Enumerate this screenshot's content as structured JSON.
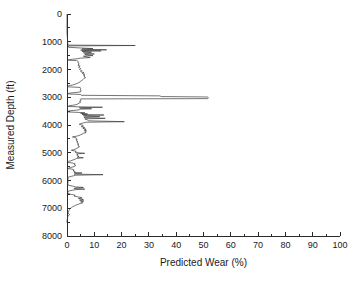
{
  "chart_data": {
    "type": "line",
    "title": "",
    "xlabel": "Predicted Wear (%)",
    "ylabel": "Measured Depth (ft)",
    "xlim": [
      0,
      100
    ],
    "ylim": [
      8000,
      0
    ],
    "y_inverted": true,
    "grid": false,
    "legend": null,
    "x_ticks": [
      0,
      10,
      20,
      30,
      40,
      50,
      60,
      70,
      80,
      90,
      100
    ],
    "x_tick_labels": [
      "0",
      "10",
      "20",
      "30",
      "40",
      "50",
      "60",
      "70",
      "80",
      "90",
      "100"
    ],
    "x_minor_tick_step": 5,
    "y_ticks": [
      0,
      1000,
      2000,
      3000,
      4000,
      5000,
      6000,
      7000,
      8000
    ],
    "y_tick_labels": [
      "0",
      "1000",
      "2000",
      "3000",
      "4000",
      "5000",
      "6000",
      "7000",
      "8000"
    ],
    "y_minor_tick_step": 500,
    "series": [
      {
        "name": "Predicted Wear",
        "color": "#3a3a3a",
        "x_key": "wear_percent",
        "y_key": "depth_ft",
        "points": [
          [
            0.0,
            0
          ],
          [
            0.0,
            700
          ],
          [
            0.2,
            900
          ],
          [
            0.3,
            1080
          ],
          [
            0.4,
            1120
          ],
          [
            25.0,
            1135
          ],
          [
            0.5,
            1150
          ],
          [
            0.6,
            1200
          ],
          [
            6.0,
            1230
          ],
          [
            9.5,
            1245
          ],
          [
            5.5,
            1260
          ],
          [
            7.0,
            1275
          ],
          [
            14.5,
            1290
          ],
          [
            5.0,
            1300
          ],
          [
            6.5,
            1315
          ],
          [
            12.5,
            1330
          ],
          [
            5.5,
            1345
          ],
          [
            7.5,
            1360
          ],
          [
            9.0,
            1380
          ],
          [
            6.0,
            1400
          ],
          [
            7.0,
            1420
          ],
          [
            10.0,
            1440
          ],
          [
            6.5,
            1460
          ],
          [
            7.5,
            1480
          ],
          [
            9.5,
            1500
          ],
          [
            6.0,
            1520
          ],
          [
            7.0,
            1545
          ],
          [
            8.5,
            1570
          ],
          [
            5.0,
            1590
          ],
          [
            4.0,
            1610
          ],
          [
            2.0,
            1630
          ],
          [
            0.4,
            1650
          ],
          [
            0.5,
            1665
          ],
          [
            3.5,
            1680
          ],
          [
            4.2,
            1720
          ],
          [
            4.0,
            1760
          ],
          [
            4.5,
            1800
          ],
          [
            4.0,
            1840
          ],
          [
            4.8,
            1880
          ],
          [
            4.2,
            1920
          ],
          [
            5.0,
            1960
          ],
          [
            4.6,
            2000
          ],
          [
            5.4,
            2040
          ],
          [
            5.0,
            2080
          ],
          [
            6.2,
            2110
          ],
          [
            5.6,
            2140
          ],
          [
            6.5,
            2170
          ],
          [
            6.0,
            2200
          ],
          [
            6.6,
            2230
          ],
          [
            6.2,
            2260
          ],
          [
            6.8,
            2290
          ],
          [
            6.3,
            2320
          ],
          [
            6.0,
            2350
          ],
          [
            5.6,
            2380
          ],
          [
            5.2,
            2410
          ],
          [
            4.8,
            2440
          ],
          [
            4.4,
            2470
          ],
          [
            3.8,
            2500
          ],
          [
            3.0,
            2530
          ],
          [
            2.0,
            2560
          ],
          [
            0.8,
            2580
          ],
          [
            0.3,
            2600
          ],
          [
            0.4,
            2625
          ],
          [
            4.8,
            2645
          ],
          [
            5.0,
            2680
          ],
          [
            4.8,
            2710
          ],
          [
            5.2,
            2740
          ],
          [
            4.9,
            2770
          ],
          [
            5.1,
            2800
          ],
          [
            4.0,
            2820
          ],
          [
            2.0,
            2840
          ],
          [
            0.5,
            2860
          ],
          [
            0.4,
            2880
          ],
          [
            5.0,
            2900
          ],
          [
            5.2,
            2930
          ],
          [
            34.0,
            2950
          ],
          [
            34.5,
            2975
          ],
          [
            51.5,
            2990
          ],
          [
            51.8,
            3030
          ],
          [
            51.5,
            3050
          ],
          [
            5.0,
            3060
          ],
          [
            4.8,
            3090
          ],
          [
            5.2,
            3120
          ],
          [
            4.6,
            3150
          ],
          [
            5.0,
            3180
          ],
          [
            4.4,
            3210
          ],
          [
            4.0,
            3240
          ],
          [
            3.2,
            3270
          ],
          [
            2.0,
            3290
          ],
          [
            0.6,
            3310
          ],
          [
            0.4,
            3330
          ],
          [
            4.0,
            3345
          ],
          [
            13.0,
            3360
          ],
          [
            4.5,
            3375
          ],
          [
            5.0,
            3400
          ],
          [
            9.0,
            3415
          ],
          [
            4.8,
            3430
          ],
          [
            4.5,
            3450
          ],
          [
            3.0,
            3470
          ],
          [
            1.0,
            3490
          ],
          [
            0.3,
            3510
          ],
          [
            0.4,
            3530
          ],
          [
            4.0,
            3545
          ],
          [
            6.5,
            3560
          ],
          [
            5.0,
            3580
          ],
          [
            7.5,
            3600
          ],
          [
            5.5,
            3620
          ],
          [
            13.5,
            3640
          ],
          [
            6.0,
            3660
          ],
          [
            6.5,
            3680
          ],
          [
            12.0,
            3700
          ],
          [
            6.2,
            3720
          ],
          [
            6.8,
            3740
          ],
          [
            14.0,
            3760
          ],
          [
            6.5,
            3780
          ],
          [
            7.0,
            3800
          ],
          [
            7.5,
            3820
          ],
          [
            8.0,
            3850
          ],
          [
            21.0,
            3880
          ],
          [
            7.0,
            3900
          ],
          [
            6.0,
            3925
          ],
          [
            5.0,
            3950
          ],
          [
            4.5,
            3975
          ],
          [
            5.5,
            4000
          ],
          [
            6.0,
            4030
          ],
          [
            5.2,
            4060
          ],
          [
            6.5,
            4090
          ],
          [
            5.8,
            4120
          ],
          [
            7.0,
            4150
          ],
          [
            6.2,
            4180
          ],
          [
            7.2,
            4210
          ],
          [
            6.5,
            4240
          ],
          [
            7.0,
            4270
          ],
          [
            6.0,
            4300
          ],
          [
            5.5,
            4330
          ],
          [
            4.8,
            4360
          ],
          [
            4.0,
            4390
          ],
          [
            3.2,
            4410
          ],
          [
            2.0,
            4430
          ],
          [
            3.0,
            4450
          ],
          [
            3.5,
            4480
          ],
          [
            3.2,
            4510
          ],
          [
            3.8,
            4540
          ],
          [
            3.4,
            4570
          ],
          [
            4.0,
            4600
          ],
          [
            3.6,
            4630
          ],
          [
            4.2,
            4660
          ],
          [
            3.8,
            4690
          ],
          [
            4.4,
            4720
          ],
          [
            4.0,
            4750
          ],
          [
            4.6,
            4780
          ],
          [
            4.2,
            4810
          ],
          [
            3.6,
            4840
          ],
          [
            3.0,
            4870
          ],
          [
            2.4,
            4890
          ],
          [
            1.6,
            4910
          ],
          [
            2.6,
            4930
          ],
          [
            3.4,
            4950
          ],
          [
            3.0,
            4980
          ],
          [
            4.0,
            5000
          ],
          [
            6.5,
            5020
          ],
          [
            3.5,
            5040
          ],
          [
            4.0,
            5070
          ],
          [
            3.6,
            5100
          ],
          [
            4.4,
            5130
          ],
          [
            3.8,
            5160
          ],
          [
            6.0,
            5180
          ],
          [
            3.6,
            5200
          ],
          [
            3.0,
            5230
          ],
          [
            2.2,
            5260
          ],
          [
            1.4,
            5290
          ],
          [
            0.6,
            5310
          ],
          [
            0.3,
            5330
          ],
          [
            0.4,
            5350
          ],
          [
            2.0,
            5370
          ],
          [
            3.0,
            5400
          ],
          [
            2.6,
            5430
          ],
          [
            3.2,
            5460
          ],
          [
            2.8,
            5490
          ],
          [
            2.2,
            5510
          ],
          [
            1.4,
            5530
          ],
          [
            0.6,
            5550
          ],
          [
            0.4,
            5570
          ],
          [
            1.8,
            5590
          ],
          [
            2.6,
            5620
          ],
          [
            2.2,
            5650
          ],
          [
            3.0,
            5680
          ],
          [
            2.6,
            5710
          ],
          [
            5.5,
            5730
          ],
          [
            3.0,
            5750
          ],
          [
            2.6,
            5770
          ],
          [
            13.2,
            5790
          ],
          [
            3.0,
            5810
          ],
          [
            2.4,
            5830
          ],
          [
            1.6,
            5850
          ],
          [
            0.8,
            5870
          ],
          [
            0.3,
            5890
          ],
          [
            0.4,
            5930
          ],
          [
            0.3,
            5990
          ],
          [
            0.4,
            6050
          ],
          [
            0.3,
            6110
          ],
          [
            0.5,
            6170
          ],
          [
            2.0,
            6200
          ],
          [
            3.0,
            6230
          ],
          [
            6.0,
            6250
          ],
          [
            3.2,
            6270
          ],
          [
            2.6,
            6290
          ],
          [
            6.5,
            6310
          ],
          [
            3.0,
            6330
          ],
          [
            2.0,
            6350
          ],
          [
            1.0,
            6370
          ],
          [
            0.4,
            6390
          ],
          [
            0.3,
            6430
          ],
          [
            0.4,
            6470
          ],
          [
            1.5,
            6500
          ],
          [
            3.0,
            6530
          ],
          [
            2.6,
            6560
          ],
          [
            4.0,
            6590
          ],
          [
            5.5,
            6620
          ],
          [
            4.2,
            6650
          ],
          [
            6.0,
            6680
          ],
          [
            4.6,
            6710
          ],
          [
            6.2,
            6740
          ],
          [
            5.0,
            6770
          ],
          [
            5.8,
            6800
          ],
          [
            4.8,
            6830
          ],
          [
            4.0,
            6860
          ],
          [
            3.2,
            6890
          ],
          [
            2.6,
            6920
          ],
          [
            2.0,
            6950
          ],
          [
            1.6,
            6980
          ],
          [
            1.2,
            7010
          ],
          [
            0.9,
            7050
          ],
          [
            0.7,
            7090
          ],
          [
            0.5,
            7130
          ],
          [
            0.4,
            7170
          ],
          [
            0.6,
            7200
          ],
          [
            1.0,
            7230
          ],
          [
            0.5,
            7260
          ],
          [
            0.3,
            7300
          ],
          [
            0.2,
            7350
          ],
          [
            0.1,
            7400
          ],
          [
            0.0,
            7450
          ],
          [
            0.0,
            7520
          ]
        ]
      }
    ]
  },
  "figure": {
    "background_color": "#ffffff",
    "axis_color": "#2b2b2b",
    "line_color": "#3a3a3a"
  }
}
